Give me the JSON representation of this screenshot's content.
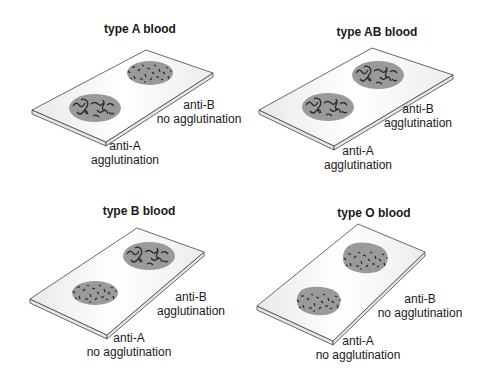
{
  "figure": {
    "colors": {
      "slide_fill": "#f4f4f4",
      "slide_edge": "#e6e6e6",
      "slide_stroke": "#444444",
      "drop_fill": "#9a9a9a",
      "clump_stroke": "#2a2a2a"
    },
    "panels": [
      {
        "id": "A",
        "title": "type A blood",
        "anti_a": {
          "label": "anti-A",
          "result": "agglutination",
          "agglutinated": true
        },
        "anti_b": {
          "label": "anti-B",
          "result": "no agglutination",
          "agglutinated": false
        }
      },
      {
        "id": "AB",
        "title": "type AB blood",
        "anti_a": {
          "label": "anti-A",
          "result": "agglutination",
          "agglutinated": true
        },
        "anti_b": {
          "label": "anti-B",
          "result": "agglutination",
          "agglutinated": true
        }
      },
      {
        "id": "B",
        "title": "type B blood",
        "anti_a": {
          "label": "anti-A",
          "result": "no agglutination",
          "agglutinated": false
        },
        "anti_b": {
          "label": "anti-B",
          "result": "agglutination",
          "agglutinated": true
        }
      },
      {
        "id": "O",
        "title": "type O blood",
        "anti_a": {
          "label": "anti-A",
          "result": "no agglutination",
          "agglutinated": false
        },
        "anti_b": {
          "label": "anti-B",
          "result": "no agglutination",
          "agglutinated": false
        }
      }
    ]
  }
}
